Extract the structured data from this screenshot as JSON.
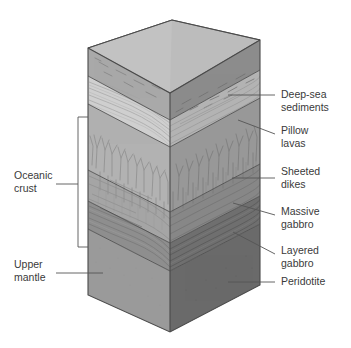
{
  "diagram": {
    "type": "geologic-block-diagram"
  },
  "left_labels": [
    {
      "id": "oceanic-crust",
      "line1": "Oceanic",
      "line2": "crust"
    },
    {
      "id": "upper-mantle",
      "line1": "Upper",
      "line2": "mantle"
    }
  ],
  "right_labels": [
    {
      "id": "deep-sea-sediments",
      "line1": "Deep-sea",
      "line2": "sediments"
    },
    {
      "id": "pillow-lavas",
      "line1": "Pillow",
      "line2": "lavas"
    },
    {
      "id": "sheeted-dikes",
      "line1": "Sheeted",
      "line2": "dikes"
    },
    {
      "id": "massive-gabbro",
      "line1": "Massive",
      "line2": "gabbro"
    },
    {
      "id": "layered-gabbro",
      "line1": "Layered",
      "line2": "gabbro"
    },
    {
      "id": "peridotite",
      "line1": "Peridotite",
      "line2": ""
    }
  ],
  "colors": {
    "top_face": "#b9b9b9",
    "sediments_left": "#a9a9a9",
    "sediments_right": "#8c8c8c",
    "pillow_left": "#cfcfcf",
    "pillow_right": "#b4b4b4",
    "dikes_left": "#b2b2b2",
    "dikes_right": "#989898",
    "massive_left": "#a5a5a5",
    "massive_right": "#878787",
    "layered_left": "#8e8e8e",
    "layered_right": "#6f6f6f",
    "peridotite_left": "#9a9a9a",
    "peridotite_right": "#6a6a6a",
    "outline": "#4a4a4a",
    "leader": "#555555",
    "text": "#3a3a3a"
  },
  "layers": [
    {
      "name": "Deep-sea sediments",
      "order": 1,
      "unit": "sediment",
      "texture": "dashes"
    },
    {
      "name": "Pillow lavas",
      "order": 2,
      "unit": "basalt",
      "texture": "wavy-lines"
    },
    {
      "name": "Sheeted dikes",
      "order": 3,
      "unit": "diabase",
      "texture": "vertical-branching"
    },
    {
      "name": "Massive gabbro",
      "order": 4,
      "unit": "gabbro",
      "texture": "horizontal-streaks"
    },
    {
      "name": "Layered gabbro",
      "order": 5,
      "unit": "gabbro",
      "texture": "horizontal-banding"
    },
    {
      "name": "Peridotite",
      "order": 6,
      "unit": "peridotite",
      "texture": "plain"
    }
  ]
}
